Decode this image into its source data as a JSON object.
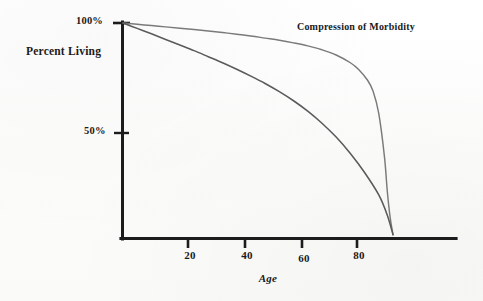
{
  "chart_data": {
    "type": "line",
    "title": "",
    "annotation": "Compression of Morbidity",
    "xlabel": "Age",
    "ylabel": "Percent Living",
    "xlim": [
      0,
      100
    ],
    "ylim": [
      0,
      100
    ],
    "grid": false,
    "legend_position": "none",
    "x_ticks": [
      {
        "value": 20,
        "label": "20"
      },
      {
        "value": 40,
        "label": "40"
      },
      {
        "value": 60,
        "label": "60"
      },
      {
        "value": 80,
        "label": "80"
      }
    ],
    "y_ticks": [
      {
        "value": 100,
        "label": "100%"
      },
      {
        "value": 50,
        "label": "50%"
      }
    ],
    "series": [
      {
        "name": "Compression of Morbidity (rectangularized survival)",
        "color": "#7a7a7a",
        "x": [
          0,
          5,
          10,
          15,
          20,
          25,
          30,
          35,
          40,
          45,
          50,
          55,
          60,
          65,
          70,
          75,
          80,
          83,
          86,
          88,
          90,
          92,
          93,
          94,
          95
        ],
        "y": [
          100,
          99.4,
          98.8,
          98.2,
          97.6,
          97.0,
          96.3,
          95.6,
          94.8,
          94.0,
          93.0,
          92.0,
          90.8,
          89.4,
          87.6,
          85.2,
          81.6,
          78.4,
          73.6,
          68.4,
          58.0,
          38.0,
          22.0,
          10.0,
          2.0
        ]
      },
      {
        "name": "Baseline survival curve",
        "color": "#5a5a5a",
        "x": [
          0,
          5,
          10,
          15,
          20,
          25,
          30,
          35,
          40,
          45,
          50,
          55,
          60,
          65,
          70,
          75,
          80,
          85,
          90,
          93,
          95
        ],
        "y": [
          100,
          97.5,
          95.0,
          92.4,
          89.8,
          87.2,
          84.4,
          81.6,
          78.6,
          75.4,
          72.0,
          68.2,
          64.0,
          59.2,
          53.6,
          47.2,
          39.6,
          30.8,
          20.4,
          11.0,
          2.0
        ]
      }
    ],
    "axis_color": "#1c1c1c"
  },
  "labels": {
    "y_axis_title": "Percent Living",
    "x_axis_title": "Age",
    "tick_100": "100%",
    "tick_50": "50%",
    "annotation": "Compression of Morbidity",
    "xtick_20": "20",
    "xtick_40": "40",
    "xtick_60": "60",
    "xtick_80": "80"
  }
}
